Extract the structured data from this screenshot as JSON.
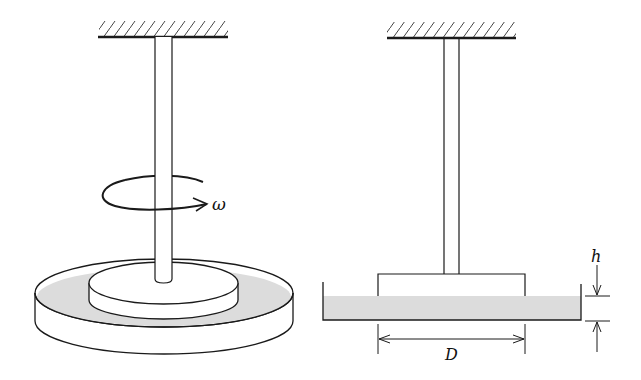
{
  "diagram": {
    "left_figure": {
      "name": "perspective-view",
      "rotation_label": "ω"
    },
    "right_figure": {
      "name": "cross-section-view",
      "gap_label": "h",
      "diameter_label": "D"
    },
    "colors": {
      "line": "#1a1a1a",
      "fluid": "#dcdcdc",
      "background": "#ffffff"
    }
  }
}
